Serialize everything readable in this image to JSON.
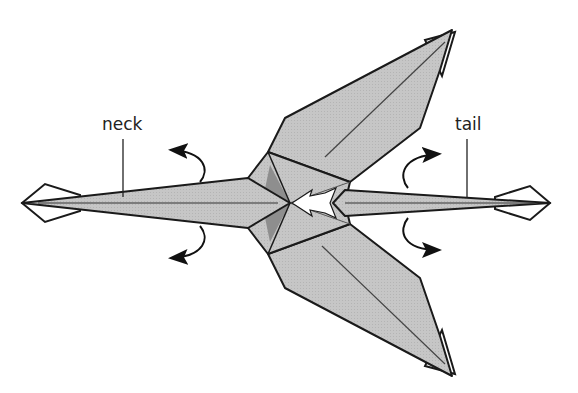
{
  "diagram": {
    "labels": {
      "neck": "neck",
      "tail": "tail"
    },
    "colors": {
      "paper": "#c4c4c4",
      "paper_shadow": "#8e8e8e",
      "outline": "#1a1a1a",
      "background": "#ffffff"
    },
    "arrows": [
      {
        "id": "neck-up",
        "direction": "fold up/back"
      },
      {
        "id": "neck-down",
        "direction": "fold down/back"
      },
      {
        "id": "tail-up",
        "direction": "fold up/back"
      },
      {
        "id": "tail-down",
        "direction": "fold down/back"
      },
      {
        "id": "center-push",
        "direction": "push / sink center"
      }
    ]
  }
}
